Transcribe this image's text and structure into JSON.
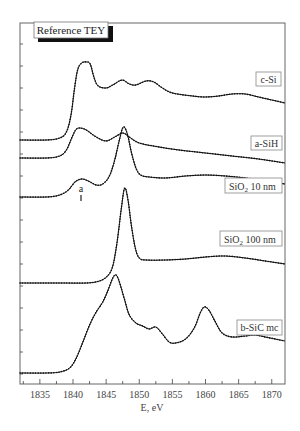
{
  "chart_data": {
    "type": "line",
    "title": "",
    "reference_label": "Reference TEY",
    "xlabel": "E, eV",
    "ylabel": "",
    "xlim": [
      1832,
      1872
    ],
    "x_ticks": [
      1835,
      1840,
      1845,
      1850,
      1855,
      1860,
      1865,
      1870
    ],
    "x_tick_labels": [
      "1835",
      "1840",
      "1845",
      "1850",
      "1855",
      "1860",
      "1865",
      "1870"
    ],
    "y_ticks_unlabeled": true,
    "grid": false,
    "legend_position": "inline labels at right of each curve",
    "annotations": [
      {
        "text": "a",
        "x": 1841.3,
        "series": "SiO2 10 nm",
        "note": "pre-edge shoulder marker"
      }
    ],
    "series": [
      {
        "name": "c-Si",
        "label_display": "c-Si",
        "points": [
          [
            1832,
            140
          ],
          [
            1836,
            140
          ],
          [
            1838,
            138
          ],
          [
            1839,
            132
          ],
          [
            1839.7,
            115
          ],
          [
            1840.2,
            90
          ],
          [
            1840.7,
            70
          ],
          [
            1841.3,
            63
          ],
          [
            1842,
            62
          ],
          [
            1842.6,
            64
          ],
          [
            1843.2,
            78
          ],
          [
            1843.8,
            86
          ],
          [
            1845,
            88
          ],
          [
            1846,
            85
          ],
          [
            1847.4,
            80
          ],
          [
            1848.5,
            84
          ],
          [
            1849.5,
            85
          ],
          [
            1851,
            81
          ],
          [
            1852.2,
            82
          ],
          [
            1853.5,
            88
          ],
          [
            1855,
            93
          ],
          [
            1858,
            96
          ],
          [
            1860,
            97
          ],
          [
            1862,
            96
          ],
          [
            1864,
            94
          ],
          [
            1866,
            94
          ],
          [
            1868,
            97
          ],
          [
            1870,
            100
          ],
          [
            1872,
            103
          ]
        ]
      },
      {
        "name": "a-SiH",
        "label_display": "a-SiH",
        "points": [
          [
            1832,
            158
          ],
          [
            1836,
            158
          ],
          [
            1838,
            156
          ],
          [
            1839,
            150
          ],
          [
            1839.8,
            138
          ],
          [
            1840.4,
            130
          ],
          [
            1841,
            128
          ],
          [
            1842,
            130
          ],
          [
            1843.5,
            137
          ],
          [
            1845,
            141
          ],
          [
            1846.3,
            137
          ],
          [
            1847.5,
            133
          ],
          [
            1848.5,
            137
          ],
          [
            1850,
            143
          ],
          [
            1853,
            147
          ],
          [
            1856,
            150
          ],
          [
            1860,
            153
          ],
          [
            1864,
            156
          ],
          [
            1868,
            159
          ],
          [
            1872,
            163
          ]
        ]
      },
      {
        "name": "SiO2 10 nm",
        "label_display": "SiO2 10 nm",
        "points": [
          [
            1832,
            197
          ],
          [
            1836,
            197
          ],
          [
            1838,
            195
          ],
          [
            1839.3,
            190
          ],
          [
            1840.3,
            182
          ],
          [
            1841.3,
            179
          ],
          [
            1842.3,
            181
          ],
          [
            1843.5,
            185
          ],
          [
            1844.5,
            184
          ],
          [
            1845.5,
            176
          ],
          [
            1846.3,
            160
          ],
          [
            1847,
            140
          ],
          [
            1847.6,
            127
          ],
          [
            1848.2,
            134
          ],
          [
            1848.8,
            152
          ],
          [
            1849.5,
            168
          ],
          [
            1850.2,
            175
          ],
          [
            1851.5,
            177
          ],
          [
            1854,
            178
          ],
          [
            1857,
            176
          ],
          [
            1860,
            175
          ],
          [
            1863,
            176
          ],
          [
            1866,
            178
          ],
          [
            1869,
            181
          ],
          [
            1872,
            184
          ]
        ]
      },
      {
        "name": "SiO2 100 nm",
        "label_display": "SiO2 100 nm",
        "points": [
          [
            1832,
            283
          ],
          [
            1838,
            283
          ],
          [
            1842,
            283
          ],
          [
            1844,
            281
          ],
          [
            1845.2,
            276
          ],
          [
            1846,
            266
          ],
          [
            1846.7,
            240
          ],
          [
            1847.3,
            208
          ],
          [
            1847.8,
            188
          ],
          [
            1848.3,
            200
          ],
          [
            1848.8,
            225
          ],
          [
            1849.4,
            248
          ],
          [
            1850,
            258
          ],
          [
            1851,
            260
          ],
          [
            1854,
            260
          ],
          [
            1857,
            259
          ],
          [
            1860,
            257
          ],
          [
            1863,
            256
          ],
          [
            1866,
            258
          ],
          [
            1869,
            261
          ],
          [
            1872,
            264
          ]
        ]
      },
      {
        "name": "b-SiC mc",
        "label_display": "b-SiC mc",
        "points": [
          [
            1832,
            373
          ],
          [
            1836,
            373
          ],
          [
            1838,
            372
          ],
          [
            1839.5,
            368
          ],
          [
            1840.5,
            358
          ],
          [
            1841.5,
            342
          ],
          [
            1842.5,
            325
          ],
          [
            1843.5,
            312
          ],
          [
            1844.5,
            302
          ],
          [
            1845.3,
            290
          ],
          [
            1846,
            278
          ],
          [
            1846.5,
            275
          ],
          [
            1847,
            282
          ],
          [
            1847.8,
            300
          ],
          [
            1848.5,
            315
          ],
          [
            1849.5,
            323
          ],
          [
            1850.5,
            326
          ],
          [
            1851.5,
            329
          ],
          [
            1852.5,
            327
          ],
          [
            1853.5,
            334
          ],
          [
            1854.5,
            342
          ],
          [
            1855.5,
            343
          ],
          [
            1857,
            339
          ],
          [
            1858.3,
            328
          ],
          [
            1859.2,
            313
          ],
          [
            1859.8,
            307
          ],
          [
            1860.5,
            310
          ],
          [
            1861.5,
            322
          ],
          [
            1862.5,
            333
          ],
          [
            1864,
            337
          ],
          [
            1866,
            336
          ],
          [
            1867.5,
            335
          ],
          [
            1869,
            337
          ],
          [
            1870.5,
            339
          ],
          [
            1872,
            341
          ]
        ]
      }
    ]
  },
  "labels": {
    "reference": "Reference TEY",
    "c_si": "c-Si",
    "a_sih": "a-SiH",
    "sio2_10_prefix": "SiO",
    "sio2_10_sub": "2",
    "sio2_10_suffix": " 10 nm",
    "sio2_100_prefix": "SiO",
    "sio2_100_sub": "2",
    "sio2_100_suffix": " 100 nm",
    "b_sic": "b-SiC mc",
    "annotation_a": "a",
    "xlabel": "E, eV"
  },
  "style": {
    "curve_color": "#111111",
    "frame_color": "#666666",
    "background": "#ffffff"
  }
}
